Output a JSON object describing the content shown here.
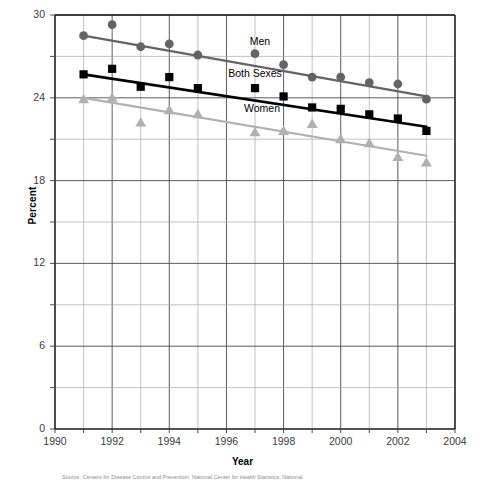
{
  "axes": {
    "ylabel": "Percent",
    "xlabel": "Year",
    "yticks": [
      "0",
      "6",
      "12",
      "18",
      "24",
      "30"
    ],
    "xticks": [
      "1990",
      "1992",
      "1994",
      "1996",
      "1998",
      "2000",
      "2002",
      "2004"
    ]
  },
  "annotations": {
    "men": "Men",
    "both": "Both Sexes",
    "women": "Women"
  },
  "colors": {
    "men": "#646464",
    "both": "#000000",
    "women": "#b0b0b0",
    "grid": "#8f8f8f",
    "axis": "#1a1a1a"
  },
  "source": {
    "line1": "Source: Centers for Disease Control and Prevention, National Center for Health Statistics, National"
  },
  "chart_data": {
    "type": "scatter",
    "title": "",
    "xlabel": "Year",
    "ylabel": "Percent",
    "xlim": [
      1990,
      2004
    ],
    "ylim": [
      0,
      30
    ],
    "xticks": [
      1990,
      1992,
      1994,
      1996,
      1998,
      2000,
      2002,
      2004
    ],
    "yticks": [
      0,
      6,
      12,
      18,
      24,
      30
    ],
    "minor_yticks": [
      3,
      9,
      15,
      21,
      27
    ],
    "grid": true,
    "legend": "inline-annotations",
    "x": [
      1991,
      1992,
      1993,
      1994,
      1995,
      1997,
      1998,
      1999,
      2000,
      2001,
      2002,
      2003
    ],
    "series": [
      {
        "name": "Men",
        "marker": "circle",
        "color": "#646464",
        "values": [
          28.5,
          29.3,
          27.7,
          27.9,
          27.1,
          27.2,
          26.4,
          25.5,
          25.5,
          25.1,
          25.0,
          23.9
        ],
        "trendline": {
          "x": [
            1991,
            2003
          ],
          "y": [
            28.5,
            24.1
          ]
        }
      },
      {
        "name": "Both Sexes",
        "marker": "square",
        "color": "#000000",
        "values": [
          25.7,
          26.1,
          24.8,
          25.5,
          24.7,
          24.7,
          24.1,
          23.3,
          23.2,
          22.8,
          22.5,
          21.6
        ],
        "trendline": {
          "x": [
            1991,
            2003
          ],
          "y": [
            25.7,
            21.9
          ]
        }
      },
      {
        "name": "Women",
        "marker": "triangle",
        "color": "#b0b0b0",
        "values": [
          23.9,
          24.0,
          22.2,
          23.1,
          22.8,
          21.5,
          21.6,
          22.1,
          21.0,
          20.7,
          19.7,
          19.3
        ],
        "trendline": {
          "x": [
            1991,
            2003
          ],
          "y": [
            24.0,
            19.8
          ]
        }
      }
    ]
  }
}
